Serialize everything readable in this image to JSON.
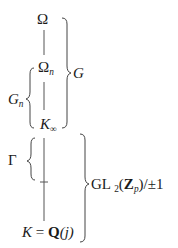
{
  "diagram": {
    "type": "field-extension-tower",
    "nodes": {
      "omega": {
        "label": "Ω"
      },
      "omega_n": {
        "label": "Ω",
        "subscript": "n"
      },
      "k_infinity": {
        "label": "K",
        "subscript": "∞"
      },
      "base_field": {
        "label_left": "K",
        "equals": "=",
        "label_right": "Q",
        "argument": "(j)"
      }
    },
    "braces": {
      "g": {
        "label": "G",
        "spans": "Ω to K∞"
      },
      "g_n": {
        "label": "G",
        "subscript": "n",
        "spans": "Ωn to K∞"
      },
      "gamma": {
        "label": "Γ",
        "spans": "K∞ to intermediate tick"
      },
      "gl2": {
        "label_prefix": "GL",
        "subscript": "2",
        "ring": "Z",
        "ring_subscript": "p",
        "suffix": "/±1",
        "open_paren": "(",
        "close_paren": ")",
        "spans": "K∞ to K = Q(j)"
      }
    },
    "colors": {
      "ink": "#1a1a1a",
      "line": "#555555"
    }
  }
}
